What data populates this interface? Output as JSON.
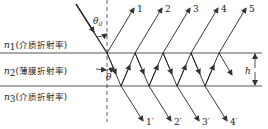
{
  "diagram": {
    "media": [
      {
        "symbol": "n",
        "sub": "1",
        "text": "(介质折射率)"
      },
      {
        "symbol": "n",
        "sub": "2",
        "text": "(薄膜折射率)"
      },
      {
        "symbol": "n",
        "sub": "3",
        "text": "(介质折射率)"
      }
    ],
    "angles": {
      "incident": "θ",
      "incident_sub": "0",
      "refracted": "θ"
    },
    "thickness_label": "h",
    "reflected_rays": [
      "1",
      "2",
      "3",
      "4",
      "5"
    ],
    "transmitted_rays": [
      "1′",
      "2′",
      "3′",
      "4′"
    ],
    "colors": {
      "line": "#333333",
      "background": "#ffffff"
    }
  }
}
